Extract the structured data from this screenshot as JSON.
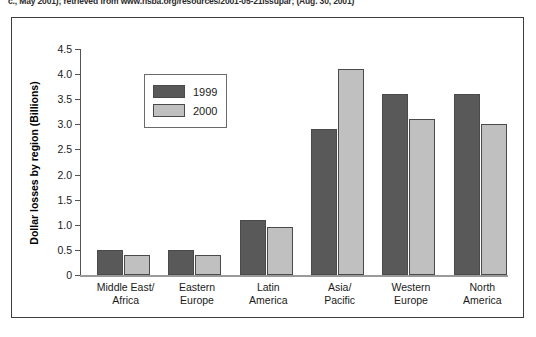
{
  "citation": {
    "text": "c., May 2001); retrieved from www.nsba.org/resources/2001-05-21issupar; (Aug. 30, 2001)"
  },
  "chart_data": {
    "type": "bar",
    "title": "",
    "xlabel": "",
    "ylabel": "Dollar losses by region (Billions)",
    "ylim": [
      0,
      4.5
    ],
    "ytick_labels": [
      "4.5",
      "4.0",
      "3.5",
      "3.0",
      "2.5",
      "2.0",
      "1.5",
      "1.0",
      "0.5",
      "0"
    ],
    "ytick_values": [
      4.5,
      4.0,
      3.5,
      3.0,
      2.5,
      2.0,
      1.5,
      1.0,
      0.5,
      0
    ],
    "grid": false,
    "legend_position": "upper-left-inside",
    "categories": [
      "Middle East/\nAfrica",
      "Eastern\nEurope",
      "Latin\nAmerica",
      "Asia/\nPacific",
      "Western\nEurope",
      "North\nAmerica"
    ],
    "category_lines": [
      [
        "Middle East/",
        "Africa"
      ],
      [
        "Eastern",
        "Europe"
      ],
      [
        "Latin",
        "America"
      ],
      [
        "Asia/",
        "Pacific"
      ],
      [
        "Western",
        "Europe"
      ],
      [
        "North",
        "America"
      ]
    ],
    "series": [
      {
        "name": "1999",
        "color": "#595959",
        "values": [
          0.5,
          0.5,
          1.1,
          2.9,
          3.6,
          3.6
        ]
      },
      {
        "name": "2000",
        "color": "#c0c0c0",
        "values": [
          0.4,
          0.4,
          0.95,
          4.1,
          3.1,
          3.0
        ]
      }
    ]
  }
}
